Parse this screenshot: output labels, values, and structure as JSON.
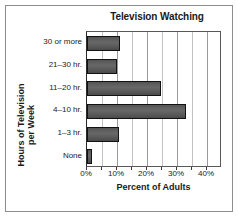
{
  "chart_data": {
    "type": "bar",
    "orientation": "horizontal",
    "title": "Television Watching",
    "xlabel": "Percent of Adults",
    "ylabel_lines": [
      "Hours of Television",
      "per Week"
    ],
    "ylabel": "Hours of Television per Week",
    "categories": [
      "30 or more",
      "21–30 hr.",
      "11–20 hr.",
      "4–10 hr.",
      "1–3 hr.",
      "None"
    ],
    "values": [
      11,
      10,
      24.5,
      33,
      10.5,
      1.5
    ],
    "xlim": [
      0,
      45
    ],
    "xticks": [
      0,
      10,
      20,
      30,
      40
    ],
    "xtick_labels": [
      "0%",
      "10%",
      "20%",
      "30%",
      "40%"
    ],
    "minor_tick_step": 5,
    "grid": "vertical",
    "legend": "none",
    "bar_color": "#5e5e5e",
    "bar_edge_color": "#121212",
    "frame_color": "#8d8d8d",
    "gridline_color": "#9a9a9a",
    "background": "#ffffff"
  }
}
